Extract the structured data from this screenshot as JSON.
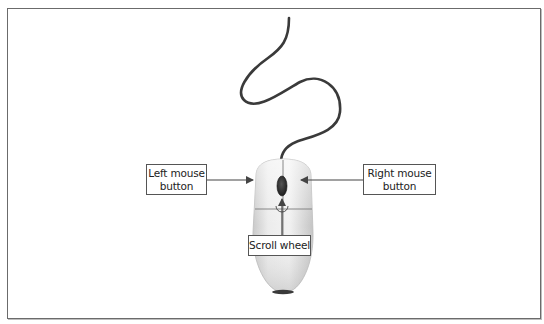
{
  "diagram": {
    "labels": {
      "left_button": {
        "line1": "Left mouse",
        "line2": "button"
      },
      "right_button": {
        "line1": "Right mouse",
        "line2": "button"
      },
      "scroll_wheel": "Scroll wheel"
    },
    "colors": {
      "frame_border": "#6b6b6b",
      "cable": "#3a3a3a",
      "mouse_body": "#e4e4e4",
      "scroll_wheel": "#2e2e2e",
      "callout_line": "#555555"
    }
  }
}
